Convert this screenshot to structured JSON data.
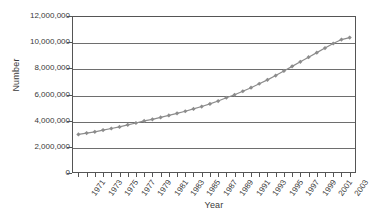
{
  "chart_data": {
    "type": "line",
    "title": "",
    "xlabel": "Year",
    "ylabel": "Number",
    "grid": true,
    "legend": "none",
    "marker": "diamond",
    "series_color": "#8c8c8c",
    "axis_color": "#555555",
    "gridline_color": "#6e6e6e",
    "ylim": [
      0,
      12000000
    ],
    "ytick_labels": [
      "12,000,000",
      "10,000,000",
      "8,000,000",
      "6,000,000",
      "4,000,000",
      "2,000,000",
      "0"
    ],
    "ytick_values": [
      12000000,
      10000000,
      8000000,
      6000000,
      4000000,
      2000000,
      0
    ],
    "xtick_labels": [
      "1971",
      "1973",
      "1975",
      "1977",
      "1979",
      "1981",
      "1983",
      "1985",
      "1987",
      "1989",
      "1991",
      "1993",
      "1995",
      "1997",
      "1999",
      "2001",
      "2003"
    ],
    "x": [
      1971,
      1972,
      1973,
      1974,
      1975,
      1976,
      1977,
      1978,
      1979,
      1980,
      1981,
      1982,
      1983,
      1984,
      1985,
      1986,
      1987,
      1988,
      1989,
      1990,
      1991,
      1992,
      1993,
      1994,
      1995,
      1996,
      1997,
      1998,
      1999,
      2000,
      2001,
      2002,
      2003,
      2004
    ],
    "values": [
      2950000,
      3050000,
      3150000,
      3280000,
      3400000,
      3520000,
      3680000,
      3820000,
      3980000,
      4100000,
      4250000,
      4400000,
      4560000,
      4720000,
      4900000,
      5080000,
      5280000,
      5500000,
      5750000,
      5980000,
      6250000,
      6520000,
      6820000,
      7120000,
      7450000,
      7800000,
      8150000,
      8500000,
      8850000,
      9200000,
      9550000,
      9900000,
      10200000,
      10350000
    ]
  }
}
